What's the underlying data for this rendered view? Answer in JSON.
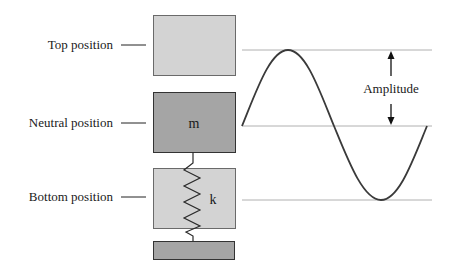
{
  "labels": {
    "top": "Top position",
    "neutral": "Neutral position",
    "bottom": "Bottom position",
    "mass": "m",
    "spring": "k",
    "amplitude": "Amplitude"
  },
  "colors": {
    "light_box": "#d3d3d3",
    "dark_box": "#a5a5a5",
    "box_border": "#444444",
    "guide_line": "#b0b0b0",
    "curve": "#3a3a3a",
    "text": "#1a1a1a"
  },
  "geometry": {
    "top_y": 50,
    "neutral_y": 126,
    "bottom_y": 200
  }
}
